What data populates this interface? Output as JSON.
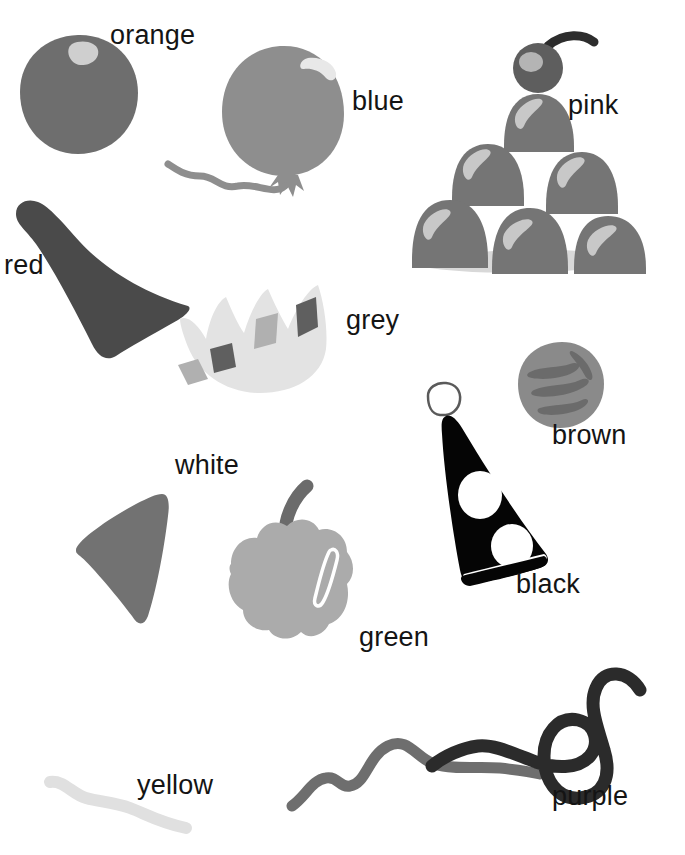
{
  "page": {
    "background_color": "#ffffff",
    "width": 685,
    "height": 855,
    "label_text_color": "#141414"
  },
  "labels": [
    {
      "id": "orange",
      "text": "orange",
      "x": 110,
      "y": 22
    },
    {
      "id": "blue",
      "text": "blue",
      "x": 352,
      "y": 88
    },
    {
      "id": "pink",
      "text": "pink",
      "x": 568,
      "y": 92
    },
    {
      "id": "red",
      "text": "red",
      "x": 4,
      "y": 252
    },
    {
      "id": "grey",
      "text": "grey",
      "x": 346,
      "y": 307
    },
    {
      "id": "brown",
      "text": "brown",
      "x": 552,
      "y": 422
    },
    {
      "id": "white",
      "text": "white",
      "x": 175,
      "y": 452
    },
    {
      "id": "black",
      "text": "black",
      "x": 516,
      "y": 571
    },
    {
      "id": "green",
      "text": "green",
      "x": 359,
      "y": 624
    },
    {
      "id": "yellow",
      "text": "yellow",
      "x": 137,
      "y": 772
    },
    {
      "id": "purple",
      "text": "purple",
      "x": 552,
      "y": 783
    }
  ],
  "objects": [
    {
      "id": "orange-ball",
      "name": "orange-fruit-drawing",
      "label_ref": "orange",
      "description": "round fruit with small highlight near top",
      "fill": "#6e6e6e",
      "highlight": "#cfcfcf",
      "x": 12,
      "y": 30,
      "w": 128,
      "h": 125
    },
    {
      "id": "blue-balloon",
      "name": "blue-balloon-drawing",
      "label_ref": "blue",
      "description": "balloon with curly string and knot, white highlight arc",
      "fill": "#8e8e8e",
      "highlight": "#e4e4e4",
      "x": 160,
      "y": 38,
      "w": 180,
      "h": 160
    },
    {
      "id": "pink-scoops",
      "name": "pink-stack-drawing",
      "label_ref": "pink",
      "description": "pyramid stack of six rounded scoops with a cherry on top and a cast shadow",
      "fill": "#757575",
      "highlight": "#c8c8c8",
      "shadow": "#d8d8d8",
      "cherry_fill": "#5e5e5e",
      "x": 400,
      "y": 30,
      "w": 260,
      "h": 250
    },
    {
      "id": "red-cone",
      "name": "red-cone-drawing",
      "label_ref": "red",
      "description": "dark funnel or party hat shape",
      "fill": "#4a4a4a",
      "x": 12,
      "y": 198,
      "w": 190,
      "h": 160
    },
    {
      "id": "grey-crown",
      "name": "grey-crown-drawing",
      "label_ref": "grey",
      "description": "pale crown with jewel facets",
      "fill": "#e3e3e3",
      "facet_light": "#b0b0b0",
      "facet_dark": "#5f5f5f",
      "x": 176,
      "y": 283,
      "w": 160,
      "h": 110
    },
    {
      "id": "brown-nut",
      "name": "brown-nut-drawing",
      "label_ref": "brown",
      "description": "round nut or potato with darker streak markings",
      "fill": "#8a8a8a",
      "marks": "#6b6b6b",
      "x": 514,
      "y": 340,
      "w": 92,
      "h": 88
    },
    {
      "id": "black-hat",
      "name": "black-party-hat-drawing",
      "label_ref": "black",
      "description": "black cone party hat with two white dot cutouts and an outlined pom-pom on top",
      "fill": "#050505",
      "dots": "#ffffff",
      "x": 410,
      "y": 382,
      "w": 150,
      "h": 206
    },
    {
      "id": "white-cone",
      "name": "white-cone-drawing",
      "label_ref": "white",
      "description": "solid mid-grey triangular wedge",
      "fill": "#727272",
      "x": 72,
      "y": 482,
      "w": 120,
      "h": 145
    },
    {
      "id": "green-pepper",
      "name": "green-bell-pepper-drawing",
      "label_ref": "green",
      "description": "bell pepper with curved stem and white highlight stripe",
      "fill": "#ababab",
      "stem": "#6b6b6b",
      "highlight": "#ffffff",
      "x": 215,
      "y": 482,
      "w": 150,
      "h": 165
    },
    {
      "id": "yellow-squiggle",
      "name": "yellow-string-drawing",
      "label_ref": "yellow",
      "description": "very pale wavy string",
      "stroke": "#e0e0e0",
      "x": 46,
      "y": 776,
      "w": 150,
      "h": 60
    },
    {
      "id": "purple-squiggle",
      "name": "purple-string-drawing",
      "label_ref": "purple",
      "description": "dark curled string with a loop",
      "stroke": "#2b2b2b",
      "x": 430,
      "y": 660,
      "w": 215,
      "h": 160
    },
    {
      "id": "grey-squiggle",
      "name": "grey-string-drawing",
      "label_ref": "green",
      "description": "mid-grey wavy string running under the dark one",
      "stroke": "#6e6e6e",
      "x": 290,
      "y": 690,
      "w": 250,
      "h": 130
    }
  ]
}
